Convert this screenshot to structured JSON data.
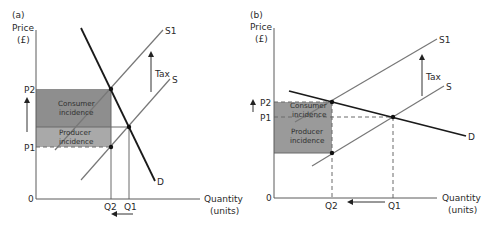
{
  "panels": [
    {
      "id": "a",
      "label": "(a)",
      "y_axis_label_line1": "Price",
      "y_axis_label_line2": "(£)",
      "x_axis_label_line1": "Quantity",
      "x_axis_label_line2": "(units)",
      "origin_label": "0",
      "price_labels": {
        "p2": "P2",
        "p1": "P1"
      },
      "quantity_labels": {
        "q2": "Q2",
        "q1": "Q1"
      },
      "curve_labels": {
        "s1": "S1",
        "s": "S",
        "d": "D"
      },
      "tax_label": "Tax",
      "consumer_incidence_line1": "Consumer",
      "consumer_incidence_line2": "incidence",
      "producer_incidence_line1": "Producer",
      "producer_incidence_line2": "incidence",
      "demand_type": "inelastic"
    },
    {
      "id": "b",
      "label": "(b)",
      "y_axis_label_line1": "Price",
      "y_axis_label_line2": "(£)",
      "x_axis_label_line1": "Quantity",
      "x_axis_label_line2": "(units)",
      "origin_label": "0",
      "price_labels": {
        "p2": "P2",
        "p1": "P1"
      },
      "quantity_labels": {
        "q2": "Q2",
        "q1": "Q1"
      },
      "curve_labels": {
        "s1": "S1",
        "s": "S",
        "d": "D"
      },
      "tax_label": "Tax",
      "consumer_incidence_line1": "Consumer",
      "consumer_incidence_line2": "incidence",
      "producer_incidence_line1": "Producer",
      "producer_incidence_line2": "incidence",
      "demand_type": "elastic"
    }
  ],
  "colors": {
    "consumer_incidence_a": "#8e8e8e",
    "producer_incidence_a": "#a9a9a9",
    "incidence_b": "#9a9a9a",
    "demand_line": "#1a1a1a",
    "supply_line": "#777777"
  }
}
